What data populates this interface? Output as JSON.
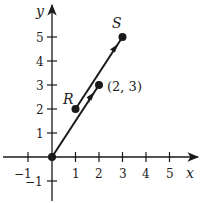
{
  "diagram": {
    "axes": {
      "x_label": "x",
      "y_label": "y",
      "x_ticks": [
        "−1",
        "1",
        "2",
        "3",
        "4",
        "5"
      ],
      "y_ticks": [
        "−1",
        "1",
        "2",
        "3",
        "4",
        "5"
      ]
    },
    "points": {
      "origin": {
        "x": 0,
        "y": 0
      },
      "R": {
        "label": "R",
        "x": 1,
        "y": 2
      },
      "S": {
        "label": "S",
        "x": 3,
        "y": 5
      },
      "P": {
        "label": "(2, 3)",
        "x": 2,
        "y": 3
      }
    },
    "vectors": [
      {
        "from": "origin",
        "to": "(2, 3)"
      },
      {
        "from": "R",
        "to": "S"
      }
    ],
    "colors": {
      "ink": "#1a1a1a",
      "background": "#ffffff"
    }
  }
}
